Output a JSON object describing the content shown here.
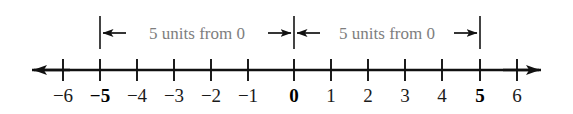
{
  "figure": {
    "type": "number-line-diagram",
    "background_color": "#ffffff",
    "axis_color": "#111111",
    "label_color": "#1a1a1a",
    "annotation_color": "#7e7e7e",
    "arrow_color": "#111111"
  },
  "number_line": {
    "ticks": [
      {
        "value": -6,
        "label": "−6",
        "emphasis": false
      },
      {
        "value": -5,
        "label": "−5",
        "emphasis": true
      },
      {
        "value": -4,
        "label": "−4",
        "emphasis": false
      },
      {
        "value": -3,
        "label": "−3",
        "emphasis": false
      },
      {
        "value": -2,
        "label": "−2",
        "emphasis": false
      },
      {
        "value": -1,
        "label": "−1",
        "emphasis": false
      },
      {
        "value": 0,
        "label": "0",
        "emphasis": true
      },
      {
        "value": 1,
        "label": "1",
        "emphasis": false
      },
      {
        "value": 2,
        "label": "2",
        "emphasis": false
      },
      {
        "value": 3,
        "label": "3",
        "emphasis": false
      },
      {
        "value": 4,
        "label": "4",
        "emphasis": false
      },
      {
        "value": 5,
        "label": "5",
        "emphasis": true
      },
      {
        "value": 6,
        "label": "6",
        "emphasis": false
      }
    ],
    "left_arrow": "left-arrowhead",
    "right_arrow": "right-arrowhead"
  },
  "annotations": [
    {
      "id": "left-span",
      "text": "5 units from 0",
      "from_value": -5,
      "to_value": 0,
      "left_arrow_icon": "left-arrowhead-icon",
      "right_arrow_icon": "right-arrowhead-icon"
    },
    {
      "id": "right-span",
      "text": "5 units from 0",
      "from_value": 0,
      "to_value": 5,
      "left_arrow_icon": "left-arrowhead-icon",
      "right_arrow_icon": "right-arrowhead-icon"
    }
  ]
}
